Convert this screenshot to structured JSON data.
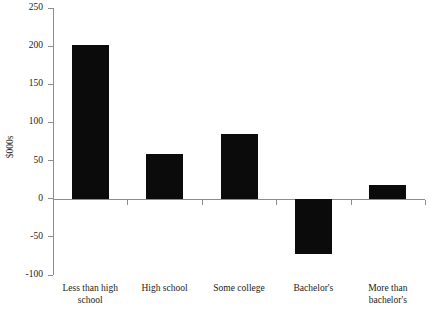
{
  "chart_data": {
    "type": "bar",
    "title": "",
    "xlabel": "",
    "ylabel": "$000s",
    "categories": [
      "Less than high\nschool",
      "High school",
      "Some college",
      "Bachelor's",
      "More than\nbachelor's"
    ],
    "values": [
      202,
      59,
      85,
      -73,
      18
    ],
    "ylim": [
      -100,
      250
    ],
    "ytick_labels": [
      "250",
      "200",
      "150",
      "100",
      "50",
      "0",
      "-50",
      "-100"
    ],
    "ytick_values": [
      250,
      200,
      150,
      100,
      50,
      0,
      -50,
      -100
    ],
    "grid": false,
    "legend": false,
    "bar_color": "#0b0b0b",
    "axis_color": "#8c8c8c"
  }
}
